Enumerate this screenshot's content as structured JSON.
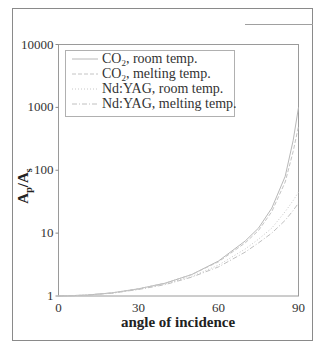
{
  "chart_data": {
    "type": "line",
    "title": "",
    "xlabel": "angle of incidence",
    "ylabel": "A_p/A_s",
    "ylabel_main": "A",
    "ylabel_sub1": "p",
    "ylabel_sep": "/A",
    "ylabel_sub2": "s",
    "x_scale": "linear",
    "y_scale": "log",
    "xlim": [
      0,
      90
    ],
    "ylim": [
      1,
      10000
    ],
    "x_ticks": [
      "0",
      "30",
      "60",
      "90"
    ],
    "y_ticks": [
      "1",
      "10",
      "100",
      "1000",
      "10000"
    ],
    "grid": false,
    "legend_position": "upper left",
    "x": [
      0,
      10,
      20,
      30,
      40,
      50,
      60,
      70,
      75,
      80,
      85,
      88,
      90
    ],
    "series": [
      {
        "name": "CO2, room temp.",
        "label_main": "CO",
        "label_sub": "2",
        "label_rest": ", room temp.",
        "color": "#b8b8b8",
        "dash": "",
        "values": [
          1,
          1.03,
          1.12,
          1.3,
          1.6,
          2.2,
          3.6,
          7.5,
          12,
          25,
          80,
          300,
          1000
        ]
      },
      {
        "name": "CO2, melting temp.",
        "label_main": "CO",
        "label_sub": "2",
        "label_rest": ", melting temp.",
        "color": "#c4c4c4",
        "dash": "4,2",
        "values": [
          1,
          1.03,
          1.12,
          1.3,
          1.6,
          2.2,
          3.5,
          7.0,
          11,
          22,
          65,
          200,
          500
        ]
      },
      {
        "name": "Nd:YAG, room temp.",
        "label_main": "Nd:YAG, room temp.",
        "label_sub": "",
        "label_rest": "",
        "color": "#c8c8c8",
        "dash": "1,2",
        "values": [
          1,
          1.03,
          1.11,
          1.28,
          1.55,
          2.05,
          3.1,
          5.6,
          8,
          12,
          22,
          33,
          45
        ]
      },
      {
        "name": "Nd:YAG, melting temp.",
        "label_main": "Nd:YAG, melting temp.",
        "label_sub": "",
        "label_rest": "",
        "color": "#c0c0c0",
        "dash": "5,2,1,2",
        "values": [
          1,
          1.03,
          1.11,
          1.27,
          1.52,
          2.0,
          2.9,
          5.0,
          7,
          10,
          16,
          23,
          30
        ]
      }
    ]
  }
}
